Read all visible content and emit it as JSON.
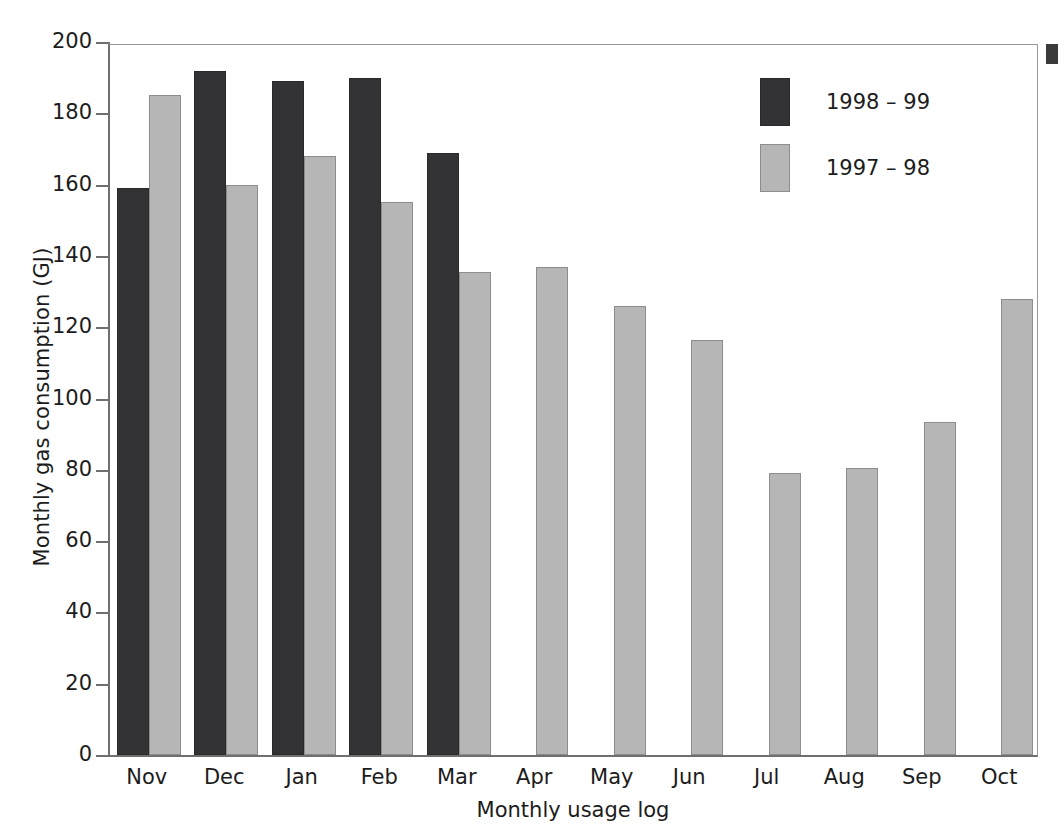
{
  "chart_data": {
    "type": "bar",
    "title": "",
    "xlabel": "Monthly usage log",
    "ylabel": "Monthly gas consumption (GJ)",
    "categories": [
      "Nov",
      "Dec",
      "Jan",
      "Feb",
      "Mar",
      "Apr",
      "May",
      "Jun",
      "Jul",
      "Aug",
      "Sep",
      "Oct"
    ],
    "ylim": [
      0,
      200
    ],
    "yticks": [
      0,
      20,
      40,
      60,
      80,
      100,
      120,
      140,
      160,
      180,
      200
    ],
    "ytick_labels": [
      "0",
      "20",
      "40",
      "60",
      "80",
      "100",
      "120",
      "140",
      "160",
      "180",
      "200"
    ],
    "grid": false,
    "legend_position": "upper right",
    "series": [
      {
        "name": "1998 – 99",
        "color": "#333335",
        "values": [
          159,
          192,
          189,
          190,
          169,
          null,
          null,
          null,
          null,
          null,
          null,
          null
        ]
      },
      {
        "name": "1997 – 98",
        "color": "#b6b6b6",
        "values": [
          185,
          160,
          168,
          155,
          135.5,
          137,
          126,
          116.5,
          79,
          80.5,
          93.5,
          128
        ]
      }
    ]
  },
  "legend": {
    "items": [
      {
        "label": "1998 – 99",
        "swatch": "dark"
      },
      {
        "label": "1997 – 98",
        "swatch": "light"
      }
    ]
  },
  "axes": {
    "y_title": "Monthly gas consumption (GJ)",
    "x_title": "Monthly usage log"
  },
  "colors": {
    "series_1998_99": "#333335",
    "series_1997_98": "#b6b6b6",
    "axis": "#6f6f6f",
    "frame": "#9a9a9a",
    "background": "#ffffff",
    "text": "#1c1c1c"
  }
}
